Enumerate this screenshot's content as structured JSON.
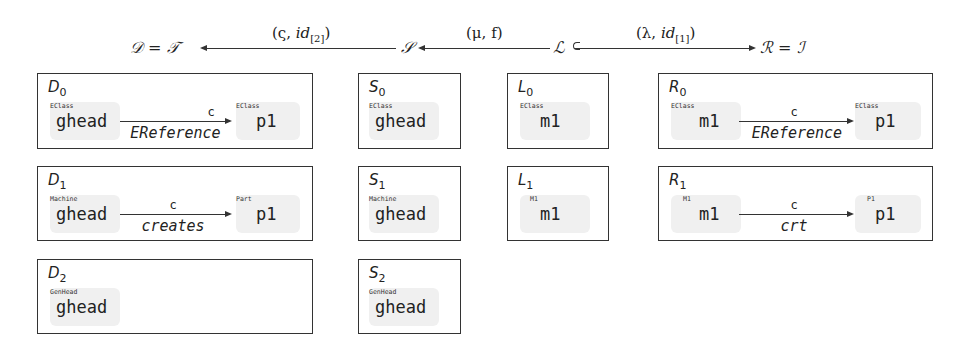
{
  "header": {
    "D": "𝒟 = 𝒯",
    "S": "𝒮",
    "L": "ℒ",
    "R": "ℛ = ℐ",
    "arrow_DS": {
      "sym": "(ς, ",
      "id": "id",
      "sub": "[2]",
      "close": ")"
    },
    "arrow_SL": {
      "text": "(μ, f)"
    },
    "arrow_LR": {
      "sym": "(λ, ",
      "id": "id",
      "sub": "[1]",
      "close": ")"
    }
  },
  "boxes": {
    "D0": {
      "name": "D",
      "sub": "0",
      "src": {
        "type": "EClass",
        "name": "ghead"
      },
      "edge": {
        "top": "c",
        "bottom": "EReference"
      },
      "tgt": {
        "type": "EClass",
        "name": "p1"
      }
    },
    "D1": {
      "name": "D",
      "sub": "1",
      "src": {
        "type": "Machine",
        "name": "ghead"
      },
      "edge": {
        "top": "c",
        "bottom": "creates"
      },
      "tgt": {
        "type": "Part",
        "name": "p1"
      }
    },
    "D2": {
      "name": "D",
      "sub": "2",
      "src": {
        "type": "GenHead",
        "name": "ghead"
      }
    },
    "S0": {
      "name": "S",
      "sub": "0",
      "src": {
        "type": "EClass",
        "name": "ghead"
      }
    },
    "S1": {
      "name": "S",
      "sub": "1",
      "src": {
        "type": "Machine",
        "name": "ghead"
      }
    },
    "S2": {
      "name": "S",
      "sub": "2",
      "src": {
        "type": "GenHead",
        "name": "ghead"
      }
    },
    "L0": {
      "name": "L",
      "sub": "0",
      "src": {
        "type": "EClass",
        "name": "m1"
      }
    },
    "L1": {
      "name": "L",
      "sub": "1",
      "src": {
        "type": "M1",
        "name": "m1"
      }
    },
    "R0": {
      "name": "R",
      "sub": "0",
      "src": {
        "type": "EClass",
        "name": "m1"
      },
      "edge": {
        "top": "c",
        "bottom": "EReference"
      },
      "tgt": {
        "type": "EClass",
        "name": "p1"
      }
    },
    "R1": {
      "name": "R",
      "sub": "1",
      "src": {
        "type": "M1",
        "name": "m1"
      },
      "edge": {
        "top": "c",
        "bottom": "crt"
      },
      "tgt": {
        "type": "P1",
        "name": "p1"
      }
    }
  }
}
